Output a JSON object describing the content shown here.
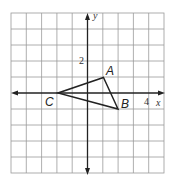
{
  "diagram": {
    "type": "coordinate-plane-triangle",
    "grid": {
      "x_min": -5,
      "x_max": 5,
      "y_min": -5,
      "y_max": 5
    },
    "axis_labels": {
      "x": "x",
      "y": "y"
    },
    "tick_labels": {
      "x": "4",
      "y": "2"
    },
    "vertices": [
      {
        "name": "A",
        "x": 1,
        "y": 1
      },
      {
        "name": "B",
        "x": 2,
        "y": -1
      },
      {
        "name": "C",
        "x": -2,
        "y": 0
      }
    ],
    "colors": {
      "grid": "#9a9a9a",
      "axis": "#222222",
      "triangle": "#222222",
      "background": "#ffffff"
    }
  }
}
